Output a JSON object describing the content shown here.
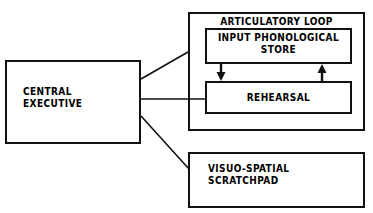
{
  "diagram": {
    "style": {
      "stroke_color": "#111111",
      "background_color": "#ffffff",
      "text_color": "#000000"
    },
    "boxes": {
      "central_executive": {
        "label": "CENTRAL\nEXECUTIVE"
      },
      "articulatory_loop": {
        "label": "ARTICULATORY LOOP"
      },
      "input_phonological_store": {
        "label": "INPUT PHONOLOGICAL\nSTORE"
      },
      "rehearsal": {
        "label": "REHEARSAL"
      },
      "visuo_spatial_scratchpad": {
        "label": "VISUO-SPATIAL\nSCRATCHPAD"
      }
    },
    "connectors": [
      {
        "name": "central-executive-to-articulatory-loop",
        "from": "central_executive",
        "to": "articulatory_loop",
        "kind": "line",
        "arrow": "none"
      },
      {
        "name": "central-executive-to-rehearsal",
        "from": "central_executive",
        "to": "rehearsal",
        "kind": "line",
        "arrow": "none"
      },
      {
        "name": "central-executive-to-visuo-spatial-scratchpad",
        "from": "central_executive",
        "to": "visuo_spatial_scratchpad",
        "kind": "line",
        "arrow": "none"
      },
      {
        "name": "store-to-rehearsal-arrow",
        "from": "input_phonological_store",
        "to": "rehearsal",
        "kind": "arrow",
        "arrow": "down"
      },
      {
        "name": "rehearsal-to-store-arrow",
        "from": "rehearsal",
        "to": "input_phonological_store",
        "kind": "arrow",
        "arrow": "up"
      }
    ]
  }
}
